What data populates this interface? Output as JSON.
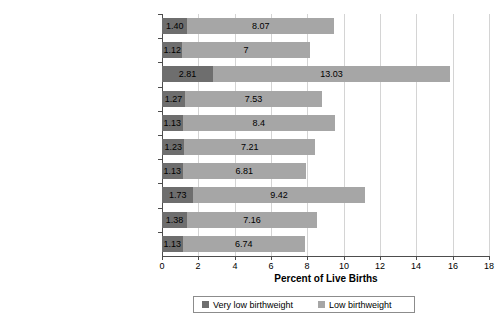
{
  "chart_data": {
    "type": "bar",
    "subtype": "stacked-horizontal-bar",
    "title": "",
    "xlabel": "Percent of Live Births",
    "ylabel": "",
    "xlim": [
      0,
      18
    ],
    "xticks": [
      0,
      2,
      4,
      6,
      8,
      10,
      12,
      14,
      16,
      18
    ],
    "grid": true,
    "legend_position": "bottom",
    "categories": [
      "Total",
      "Non-Hispanic White",
      "Non-Hispanic Black",
      "American Indian/Alaska Native",
      "Asian/Pacific Islander",
      "Hispanic (Total)",
      "Mexican",
      "Puerto Rican",
      "Cuban",
      "Central and South American"
    ],
    "series": [
      {
        "name": "Very low birthweight",
        "color": "#6e6e6e",
        "values": [
          1.4,
          1.12,
          2.81,
          1.27,
          1.13,
          1.23,
          1.13,
          1.73,
          1.38,
          1.13
        ],
        "labels": [
          "1.40",
          "1.12",
          "2.81",
          "1.27",
          "1.13",
          "1.23",
          "1.13",
          "1.73",
          "1.38",
          "1.13"
        ]
      },
      {
        "name": "Low birthweight",
        "color": "#a6a6a6",
        "values": [
          8.07,
          7,
          13.03,
          7.53,
          8.4,
          7.21,
          6.81,
          9.42,
          7.16,
          6.74
        ],
        "labels": [
          "8.07",
          "7",
          "13.03",
          "7.53",
          "8.4",
          "7.21",
          "6.81",
          "9.42",
          "7.16",
          "6.74"
        ]
      }
    ],
    "totals": [
      9.47,
      8.12,
      15.84,
      8.8,
      9.53,
      8.44,
      7.94,
      11.15,
      8.54,
      7.87
    ]
  },
  "legend": {
    "entries": [
      {
        "label": "Very low birthweight",
        "color": "#6e6e6e"
      },
      {
        "label": "Low birthweight",
        "color": "#a6a6a6"
      }
    ]
  },
  "axis": {
    "x_title": "Percent of Live Births"
  }
}
